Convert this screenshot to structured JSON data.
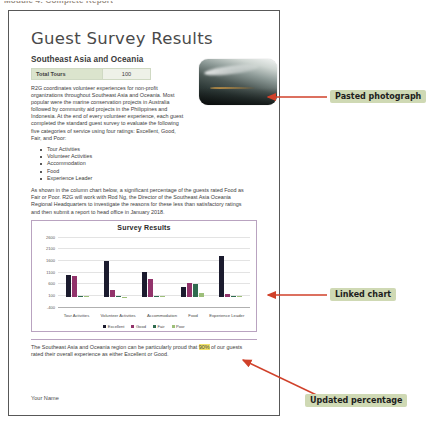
{
  "top_caption": "Module 4: Complete Report",
  "document": {
    "title": "Guest Survey Results",
    "subtitle": "Southeast Asia and Oceania",
    "tours_table": {
      "label": "Total Tours",
      "value": "100"
    },
    "intro_paragraph": "R2G coordinates volunteer experiences for non-profit organizations throughout Southeast Asia and Oceania. Most popular were the marine conservation projects in Australia followed by community aid projects in the Philippines and Indonesia. At the end of every volunteer experience, each guest completed the standard guest survey to evaluate the following five categories of service using four ratings: Excellent, Good, Fair, and Poor:",
    "bullets": [
      "Tour Activities",
      "Volunteer Activities",
      "Accommodation",
      "Food",
      "Experience Leader"
    ],
    "analysis_paragraph": "As shown in the column chart below, a significant percentage of the guests rated Food as Fair or Poor. R2G will work with Rod Ng, the Director of the Southeast Asia Oceania Regional Headquarters to investigate the reasons for these less than satisfactory ratings and then submit a report to head office in January 2018.",
    "closing_paragraph_before": "The Southeast Asia and Oceania region can be particularly proud that ",
    "closing_highlight": "90%",
    "closing_paragraph_after": " of our guests rated their overall experience as either Excellent or Good.",
    "footer_name": "Your Name",
    "photo_alt": "pasted-photograph"
  },
  "chart_data": {
    "type": "bar",
    "title": "Survey Results",
    "xlabel": "",
    "ylabel": "",
    "ylim": [
      -400,
      2600
    ],
    "yticks": [
      2600,
      2100,
      1600,
      1100,
      600,
      100,
      -400
    ],
    "grid": true,
    "legend_position": "bottom",
    "categories": [
      "Tour Activities",
      "Volunteer Activities",
      "Accommodation",
      "Food",
      "Experience Leader"
    ],
    "series": [
      {
        "name": "Excellent",
        "color": "#1b1b2e",
        "values": [
          950,
          1550,
          1100,
          450,
          1750
        ]
      },
      {
        "name": "Good",
        "color": "#92336b",
        "values": [
          900,
          330,
          790,
          600,
          160
        ]
      },
      {
        "name": "Fair",
        "color": "#2f6b4f",
        "values": [
          60,
          40,
          70,
          560,
          40
        ]
      },
      {
        "name": "Poor",
        "color": "#9dbf7a",
        "values": [
          40,
          30,
          60,
          200,
          35
        ]
      }
    ]
  },
  "annotations": [
    {
      "label": "Pasted photograph",
      "arrow_color": "#d0412a"
    },
    {
      "label": "Linked chart",
      "arrow_color": "#d0412a"
    },
    {
      "label": "Updated percentage",
      "arrow_color": "#d0412a"
    }
  ],
  "colors": {
    "callout_bg": "#cfd9b4",
    "arrow": "#d0412a",
    "highlight": "#f2e36a",
    "table_header": "#dbe4cd"
  }
}
